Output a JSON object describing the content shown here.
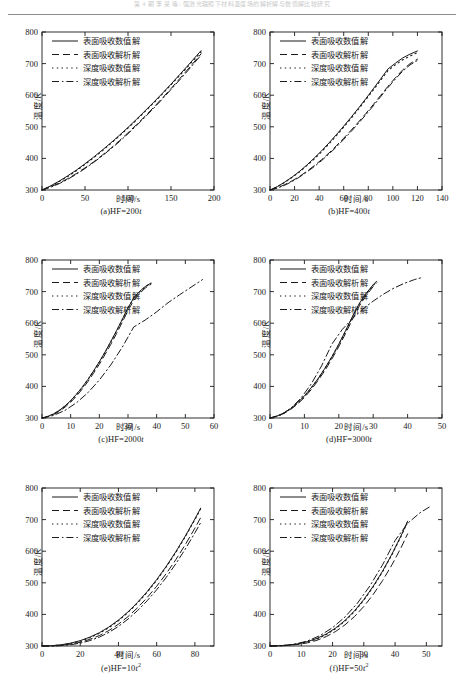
{
  "header": {
    "text": "第 4 期   李 某 等: 强激光辐照下材料温度场的解析解与数值解比较研究"
  },
  "axis": {
    "ylabel": "温度/K",
    "xlabel": "时间/s"
  },
  "legend": {
    "entries": [
      {
        "label": "表面吸收数值解",
        "style": "solid"
      },
      {
        "label": "表面吸收解析解",
        "style": "dashed"
      },
      {
        "label": "深度吸收数值解",
        "style": "dotted"
      },
      {
        "label": "深度吸收解析解",
        "style": "dashdot"
      }
    ]
  },
  "chart_data": [
    {
      "type": "line",
      "panel": "a",
      "caption_prefix": "(a)HF=200",
      "caption_var": "t",
      "caption_exp": "",
      "title": "",
      "xlabel": "时间/s",
      "ylabel": "温度/K",
      "xlim": [
        0,
        200
      ],
      "ylim": [
        300,
        800
      ],
      "xticks": [
        0,
        50,
        100,
        150,
        200
      ],
      "yticks": [
        300,
        400,
        500,
        600,
        700,
        800
      ],
      "grid": false,
      "legend_position": "top-left",
      "x": [
        0,
        10,
        20,
        30,
        40,
        50,
        60,
        70,
        80,
        90,
        100,
        110,
        120,
        130,
        140,
        150,
        160,
        170,
        180,
        185
      ],
      "series": [
        {
          "name": "表面吸收数值解",
          "style": "solid",
          "values": [
            300,
            313,
            328,
            345,
            363,
            383,
            404,
            426,
            449,
            473,
            498,
            524,
            551,
            578,
            606,
            635,
            665,
            695,
            726,
            741
          ]
        },
        {
          "name": "表面吸收解析解",
          "style": "dashed",
          "values": [
            300,
            310,
            322,
            336,
            352,
            370,
            389,
            410,
            432,
            456,
            481,
            507,
            534,
            562,
            591,
            621,
            652,
            683,
            715,
            731
          ]
        },
        {
          "name": "深度吸收数值解",
          "style": "dotted",
          "values": [
            300,
            312,
            327,
            343,
            361,
            381,
            402,
            424,
            447,
            471,
            496,
            522,
            549,
            576,
            604,
            633,
            662,
            692,
            722,
            737
          ]
        },
        {
          "name": "深度吸收解析解",
          "style": "dashdot",
          "values": [
            300,
            309,
            320,
            334,
            350,
            368,
            387,
            408,
            430,
            453,
            478,
            504,
            531,
            559,
            588,
            618,
            648,
            679,
            711,
            727
          ]
        }
      ]
    },
    {
      "type": "line",
      "panel": "b",
      "caption_prefix": "(b)HF=400",
      "caption_var": "t",
      "caption_exp": "",
      "title": "",
      "xlabel": "时间/s",
      "ylabel": "温度/K",
      "xlim": [
        0,
        140
      ],
      "ylim": [
        300,
        800
      ],
      "xticks": [
        0,
        20,
        40,
        60,
        80,
        100,
        120,
        140
      ],
      "yticks": [
        300,
        400,
        500,
        600,
        700,
        800
      ],
      "grid": false,
      "legend_position": "top-left",
      "x": [
        0,
        6,
        12,
        18,
        24,
        30,
        36,
        42,
        48,
        54,
        60,
        66,
        72,
        78,
        84,
        90,
        96,
        102,
        108,
        114,
        120
      ],
      "series": [
        {
          "name": "表面吸收数值解",
          "style": "solid",
          "values": [
            300,
            311,
            325,
            341,
            359,
            379,
            401,
            424,
            449,
            475,
            502,
            530,
            559,
            589,
            620,
            651,
            683,
            701,
            718,
            730,
            740
          ]
        },
        {
          "name": "表面吸收解析解",
          "style": "dashed",
          "values": [
            300,
            307,
            317,
            329,
            343,
            359,
            377,
            396,
            417,
            440,
            464,
            489,
            515,
            542,
            570,
            599,
            628,
            655,
            680,
            700,
            714
          ]
        },
        {
          "name": "深度吸收数值解",
          "style": "dotted",
          "values": [
            300,
            310,
            324,
            340,
            357,
            377,
            398,
            421,
            446,
            472,
            499,
            527,
            556,
            586,
            616,
            647,
            678,
            696,
            712,
            724,
            735
          ]
        },
        {
          "name": "深度吸收解析解",
          "style": "dashdot",
          "values": [
            300,
            306,
            315,
            327,
            341,
            357,
            374,
            393,
            414,
            436,
            460,
            485,
            511,
            538,
            566,
            595,
            624,
            651,
            676,
            696,
            710
          ]
        }
      ]
    },
    {
      "type": "line",
      "panel": "c",
      "caption_prefix": "(c)HF=2000",
      "caption_var": "t",
      "caption_exp": "",
      "title": "",
      "xlabel": "时间/s",
      "ylabel": "温度/K",
      "xlim": [
        0,
        60
      ],
      "ylim": [
        300,
        800
      ],
      "xticks": [
        0,
        10,
        20,
        30,
        40,
        50,
        60
      ],
      "yticks": [
        300,
        400,
        500,
        600,
        700,
        800
      ],
      "grid": false,
      "legend_position": "top-left",
      "x": [
        0,
        2,
        4,
        6,
        8,
        10,
        12,
        14,
        16,
        18,
        20,
        22,
        24,
        26,
        28,
        30,
        32,
        34,
        36,
        38
      ],
      "series": [
        {
          "name": "表面吸收数值解",
          "style": "solid",
          "values": [
            300,
            305,
            313,
            324,
            338,
            355,
            375,
            397,
            422,
            449,
            478,
            509,
            542,
            576,
            612,
            649,
            680,
            700,
            716,
            727
          ]
        },
        {
          "name": "表面吸收解析解",
          "style": "dashed",
          "values": [
            300,
            304,
            311,
            321,
            334,
            350,
            369,
            391,
            415,
            442,
            470,
            501,
            533,
            567,
            603,
            640,
            672,
            694,
            711,
            723
          ]
        },
        {
          "name": "深度吸收数值解",
          "style": "dotted",
          "values": [
            300,
            305,
            312,
            323,
            337,
            354,
            374,
            396,
            421,
            448,
            477,
            508,
            541,
            575,
            611,
            648,
            679,
            699,
            715,
            726
          ]
        },
        {
          "name": "深度吸收解析解",
          "style": "dashdot",
          "values": [
            300,
            303,
            308,
            315,
            324,
            335,
            348,
            363,
            380,
            399,
            420,
            443,
            468,
            495,
            524,
            555,
            588,
            623,
            660,
            699
          ]
        }
      ],
      "depth_analytic_x": [
        0,
        4,
        8,
        12,
        16,
        20,
        24,
        28,
        32,
        36,
        40,
        44,
        48,
        52,
        56
      ],
      "depth_analytic_values": [
        300,
        308,
        324,
        348,
        380,
        420,
        468,
        524,
        588,
        610,
        636,
        665,
        690,
        714,
        738
      ]
    },
    {
      "type": "line",
      "panel": "d",
      "caption_prefix": "(d)HF=3000",
      "caption_var": "t",
      "caption_exp": "",
      "title": "",
      "xlabel": "时间/s",
      "ylabel": "温度/K",
      "xlim": [
        0,
        50
      ],
      "ylim": [
        300,
        800
      ],
      "xticks": [
        0,
        10,
        20,
        30,
        40,
        50
      ],
      "yticks": [
        300,
        400,
        500,
        600,
        700,
        800
      ],
      "grid": false,
      "legend_position": "top-left",
      "x": [
        0,
        2,
        4,
        6,
        8,
        10,
        12,
        14,
        16,
        18,
        20,
        22,
        24,
        26,
        28,
        30,
        31
      ],
      "series": [
        {
          "name": "表面吸收数值解",
          "style": "solid",
          "values": [
            300,
            306,
            316,
            330,
            348,
            370,
            396,
            425,
            458,
            494,
            534,
            577,
            622,
            663,
            695,
            722,
            733
          ]
        },
        {
          "name": "表面吸收解析解",
          "style": "dashed",
          "values": [
            300,
            305,
            314,
            327,
            344,
            365,
            390,
            419,
            451,
            487,
            526,
            568,
            613,
            655,
            688,
            716,
            728
          ]
        },
        {
          "name": "深度吸收数值解",
          "style": "dotted",
          "values": [
            300,
            306,
            315,
            329,
            347,
            369,
            395,
            424,
            457,
            493,
            532,
            575,
            620,
            661,
            693,
            720,
            731
          ]
        },
        {
          "name": "深度吸收解析解",
          "style": "dashdot",
          "values": [
            300,
            303,
            309,
            318,
            330,
            345,
            363,
            384,
            408,
            435,
            465,
            498,
            534,
            573,
            615,
            660,
            684
          ]
        }
      ],
      "depth_analytic_x": [
        0,
        3,
        6,
        9,
        12,
        15,
        18,
        21,
        24,
        27,
        30,
        33,
        36,
        39,
        42,
        44
      ],
      "depth_analytic_values": [
        300,
        309,
        330,
        363,
        408,
        465,
        534,
        580,
        615,
        645,
        670,
        692,
        711,
        726,
        738,
        744
      ]
    },
    {
      "type": "line",
      "panel": "e",
      "caption_prefix": "(e)HF=10",
      "caption_var": "t",
      "caption_exp": "2",
      "title": "",
      "xlabel": "时间/s",
      "ylabel": "温度/K",
      "xlim": [
        0,
        90
      ],
      "ylim": [
        300,
        800
      ],
      "xticks": [
        0,
        20,
        40,
        60,
        80
      ],
      "yticks": [
        300,
        400,
        500,
        600,
        700,
        800
      ],
      "grid": false,
      "legend_position": "top-left",
      "x": [
        0,
        5,
        10,
        15,
        20,
        25,
        30,
        35,
        40,
        45,
        50,
        55,
        60,
        65,
        70,
        75,
        80,
        83
      ],
      "series": [
        {
          "name": "表面吸收数值解",
          "style": "solid",
          "values": [
            300,
            301,
            304,
            309,
            317,
            328,
            342,
            360,
            382,
            408,
            438,
            472,
            510,
            552,
            598,
            648,
            702,
            736
          ]
        },
        {
          "name": "表面吸收解析解",
          "style": "dashed",
          "values": [
            300,
            300,
            302,
            306,
            312,
            321,
            333,
            349,
            369,
            393,
            421,
            453,
            489,
            529,
            573,
            621,
            673,
            706
          ]
        },
        {
          "name": "深度吸收数值解",
          "style": "dotted",
          "values": [
            300,
            301,
            303,
            308,
            315,
            326,
            340,
            358,
            380,
            406,
            436,
            470,
            508,
            550,
            596,
            646,
            700,
            734
          ]
        },
        {
          "name": "深度吸收解析解",
          "style": "dashdot",
          "values": [
            300,
            300,
            301,
            304,
            309,
            317,
            328,
            343,
            362,
            385,
            412,
            443,
            478,
            517,
            560,
            607,
            658,
            690
          ]
        }
      ]
    },
    {
      "type": "line",
      "panel": "f",
      "caption_prefix": "(f)HF=50",
      "caption_var": "t",
      "caption_exp": "2",
      "title": "",
      "xlabel": "时间/s",
      "ylabel": "温度/K",
      "xlim": [
        0,
        55
      ],
      "ylim": [
        300,
        800
      ],
      "xticks": [
        0,
        10,
        20,
        30,
        40,
        50
      ],
      "yticks": [
        300,
        400,
        500,
        600,
        700,
        800
      ],
      "grid": false,
      "legend_position": "top-left",
      "x": [
        0,
        3,
        6,
        9,
        12,
        15,
        18,
        21,
        24,
        27,
        30,
        33,
        36,
        39,
        42,
        44
      ],
      "series": [
        {
          "name": "表面吸收数值解",
          "style": "solid",
          "values": [
            300,
            301,
            303,
            307,
            314,
            324,
            338,
            357,
            381,
            411,
            447,
            489,
            537,
            591,
            651,
            695
          ]
        },
        {
          "name": "表面吸收解析解",
          "style": "dashed",
          "values": [
            300,
            300,
            302,
            305,
            310,
            318,
            330,
            346,
            367,
            393,
            425,
            463,
            507,
            557,
            613,
            655
          ]
        },
        {
          "name": "深度吸收数值解",
          "style": "dotted",
          "values": [
            300,
            301,
            303,
            306,
            313,
            322,
            336,
            355,
            379,
            409,
            445,
            487,
            535,
            589,
            649,
            693
          ]
        },
        {
          "name": "深度吸收解析解",
          "style": "dashdot",
          "values": [
            300,
            300,
            301,
            304,
            308,
            315,
            325,
            339,
            358,
            382,
            411,
            446,
            487,
            534,
            587,
            628
          ]
        }
      ],
      "depth_analytic_x": [
        0,
        4,
        8,
        12,
        16,
        20,
        24,
        28,
        32,
        36,
        40,
        44,
        48,
        51
      ],
      "depth_analytic_values": [
        300,
        301,
        306,
        316,
        333,
        358,
        392,
        436,
        491,
        557,
        634,
        688,
        722,
        740
      ]
    }
  ]
}
